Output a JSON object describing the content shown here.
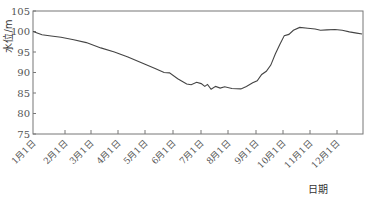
{
  "chart_data": {
    "type": "line",
    "title": "",
    "xlabel": "日期",
    "ylabel": "水位/m",
    "ylim": [
      75,
      105
    ],
    "yticks": [
      75,
      80,
      85,
      90,
      95,
      100,
      105
    ],
    "grid": false,
    "legend": null,
    "xtick_labels": [
      "1月1日",
      "2月1日",
      "3月1日",
      "4月1日",
      "5月1日",
      "6月1日",
      "7月1日",
      "8月1日",
      "9月1日",
      "10月1日",
      "11月1日",
      "12月1日"
    ],
    "series": [
      {
        "name": "水位",
        "color": "#444444",
        "points": [
          {
            "day": 0,
            "value": 100.0
          },
          {
            "day": 10,
            "value": 99.2
          },
          {
            "day": 20,
            "value": 98.9
          },
          {
            "day": 31,
            "value": 98.6
          },
          {
            "day": 45,
            "value": 98.0
          },
          {
            "day": 59,
            "value": 97.3
          },
          {
            "day": 75,
            "value": 96.0
          },
          {
            "day": 90,
            "value": 95.0
          },
          {
            "day": 105,
            "value": 93.8
          },
          {
            "day": 120,
            "value": 92.4
          },
          {
            "day": 135,
            "value": 91.0
          },
          {
            "day": 145,
            "value": 90.0
          },
          {
            "day": 151,
            "value": 89.9
          },
          {
            "day": 160,
            "value": 88.5
          },
          {
            "day": 170,
            "value": 87.2
          },
          {
            "day": 175,
            "value": 87.0
          },
          {
            "day": 181,
            "value": 87.6
          },
          {
            "day": 186,
            "value": 87.3
          },
          {
            "day": 190,
            "value": 86.6
          },
          {
            "day": 193,
            "value": 87.1
          },
          {
            "day": 197,
            "value": 85.9
          },
          {
            "day": 202,
            "value": 86.6
          },
          {
            "day": 207,
            "value": 86.2
          },
          {
            "day": 212,
            "value": 86.5
          },
          {
            "day": 220,
            "value": 86.1
          },
          {
            "day": 230,
            "value": 86.0
          },
          {
            "day": 236,
            "value": 86.6
          },
          {
            "day": 243,
            "value": 87.5
          },
          {
            "day": 248,
            "value": 88.0
          },
          {
            "day": 253,
            "value": 89.5
          },
          {
            "day": 258,
            "value": 90.3
          },
          {
            "day": 263,
            "value": 91.8
          },
          {
            "day": 268,
            "value": 94.5
          },
          {
            "day": 273,
            "value": 96.8
          },
          {
            "day": 278,
            "value": 99.0
          },
          {
            "day": 283,
            "value": 99.3
          },
          {
            "day": 288,
            "value": 100.3
          },
          {
            "day": 295,
            "value": 101.0
          },
          {
            "day": 304,
            "value": 100.8
          },
          {
            "day": 312,
            "value": 100.6
          },
          {
            "day": 318,
            "value": 100.3
          },
          {
            "day": 325,
            "value": 100.4
          },
          {
            "day": 334,
            "value": 100.5
          },
          {
            "day": 342,
            "value": 100.3
          },
          {
            "day": 350,
            "value": 99.9
          },
          {
            "day": 358,
            "value": 99.6
          },
          {
            "day": 364,
            "value": 99.4
          }
        ]
      }
    ]
  },
  "layout": {
    "plot_left": 33,
    "plot_right": 363,
    "plot_top": 11,
    "plot_bottom": 134,
    "xtick_px": [
      33,
      65,
      91,
      118,
      145,
      173,
      201,
      228,
      256,
      283,
      310,
      337
    ],
    "axis_color": "#777777",
    "line_color": "#444444"
  }
}
